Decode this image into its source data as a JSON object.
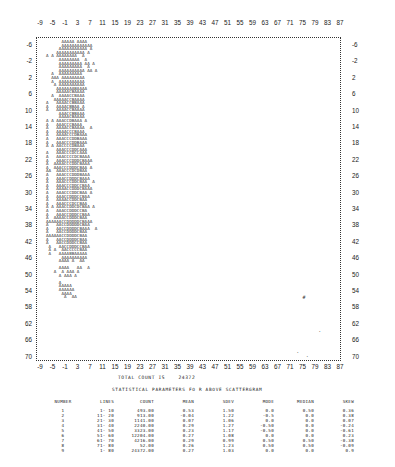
{
  "chart_data": {
    "type": "scatter",
    "xlabel": "",
    "ylabel": "",
    "x_ticks": [
      -9,
      -5,
      -1,
      3,
      7,
      11,
      15,
      19,
      23,
      27,
      31,
      35,
      39,
      43,
      47,
      51,
      55,
      59,
      63,
      67,
      71,
      75,
      79,
      83,
      87
    ],
    "y_ticks": [
      -6,
      -2,
      2,
      6,
      10,
      14,
      18,
      22,
      26,
      30,
      34,
      38,
      42,
      46,
      50,
      54,
      58,
      62,
      66,
      70
    ],
    "xlim": [
      -9,
      87
    ],
    "ylim": [
      -6,
      72
    ],
    "grid": false,
    "legend": "none",
    "density_rows": [
      "      AAAAA AAAA",
      "      AAAAAAAAAAAA",
      "     AAAAAAAAAAA A",
      "    AAAAAAAAAAA A",
      "A A AAAAAAAA  A",
      "     AAAAAAAA  A",
      "     AAAAAAAAA AA A",
      "     AAAAAAAAA  A",
      "     AAAAAAAAAA AA A",
      "  A  AAAAAAAAA",
      "  AAA AAAAAAAAA",
      "  A  AAAAAAAAAA",
      "   A AAAAAAAAAA",
      "    AAAAAAABAAAA",
      "    AAAAACBAAAA",
      "  A  AAAACCBAAA",
      "   AAAAACCBAAAA",
      "A   AAAACCBBAAA",
      "A   AAAACBBAA A",
      "A   AAAACCBAAAA",
      "     AAACCBBAAA",
      "     AAAACBAAAA",
      "A A AAACCDBAAA A",
      "A   AAACCCBAAA",
      "A   AAAACCBAAAA  A",
      "A   AAAACCCBAAA",
      "A   AAAACCCDBAAA",
      "A   AAACCCDDBAAA",
      "A   AAACCCDDBAAA",
      "A A AACCCCDBAAA",
      "    AAACCCDDCAAA",
      "A   AAACCCDCCAAA",
      "A   AAACCCCDCBAAA",
      "A   AAACCCDDDCBAAA",
      "A  AAAACCCDDCBAAA",
      "A  AAACCCDDDCBAA A",
      "AA  AAACCCDCDBAA",
      "A   AAACCCDDDBAAA",
      "A   AAACCDDDCBAAA",
      "A   AAACCCDDCBAA  A",
      "A   AAACCCDDCCBAA",
      "A   AAAACCDDDCBAAA",
      "A   AAACCCDDCBAA A",
      "A   AAACCDDDCCBAA",
      "A   AAAACCDDCBAA",
      "A   AAACCCDCCBAA",
      "A A AAACCDDCDCBAA A",
      "A   AAACCDDDCCBA",
      "A   AAACCDDDCCBAA",
      "A  AAAACCDDDCBAA",
      "AAAAAACCDDDDDCBAAA",
      "A   AACCDDDDDCBAA",
      "A   AACCDDDDCBAAA  A",
      "A   AACCDDDDCBAA",
      "AAAAAACCDDDDCBAA",
      "A   AACCDDDDCBAA",
      "A   AACCDDDCCBAA",
      " A   AACCDDDCCBAA",
      " A A  AACCCCCBAA",
      " A   AAAABBAAAAA",
      "      AAAAAAAAAA",
      "     AAAA A  AA",
      "",
      "     AAAA   AA  A",
      "   A  A AAA A",
      "     A AAA A",
      "",
      "     A",
      "     AAAAA",
      "     AAAAAA",
      "      AAAA",
      "       A  AA"
    ],
    "outliers": [
      {
        "x": 75,
        "y": 57,
        "glyph": "#"
      },
      {
        "x": 80,
        "y": 65,
        "glyph": "."
      },
      {
        "x": 73,
        "y": 70,
        "glyph": "."
      },
      {
        "x": 76,
        "y": 71,
        "glyph": "."
      },
      {
        "x": 79,
        "y": 72,
        "glyph": "."
      }
    ],
    "density_legend": "A < B < C < D (increasing point count per cell)",
    "total_count": "24372",
    "statistics_table": {
      "title": "STATISTICAL PARAMETERS FO R ABOVE SCATTERGRAM",
      "columns": [
        "NUMBER",
        "LINES",
        "COUNT",
        "MEAN",
        "SDEV",
        "MODE",
        "MEDIAN",
        "SKEW"
      ],
      "rows": [
        [
          "1",
          "1- 10",
          "493.00",
          "0.53",
          "1.50",
          "0.0",
          "0.50",
          "0.36"
        ],
        [
          "2",
          "11- 20",
          "913.00",
          "-0.04",
          "1.22",
          "-0.5",
          "0.0",
          "0.38"
        ],
        [
          "3",
          "21- 30",
          "1141.00",
          "0.07",
          "1.06",
          "0.0",
          "0.0",
          "0.07"
        ],
        [
          "4",
          "31- 40",
          "2240.00",
          "0.29",
          "1.27",
          "-0.50",
          "0.0",
          "-0.24"
        ],
        [
          "5",
          "41- 50",
          "3323.00",
          "0.23",
          "1.17",
          "-0.50",
          "0.0",
          "-0.61"
        ],
        [
          "6",
          "51- 60",
          "12204.00",
          "0.27",
          "1.08",
          "0.0",
          "0.0",
          "0.23"
        ],
        [
          "7",
          "61- 70",
          "4216.00",
          "0.29",
          "0.99",
          "0.50",
          "0.50",
          "-0.38"
        ],
        [
          "8",
          "71- 80",
          "52.00",
          "0.26",
          "1.23",
          "0.50",
          "0.50",
          "-0.09"
        ],
        [
          "9",
          "1- 80",
          "24372.00",
          "0.27",
          "1.03",
          "0.0",
          "0.0",
          "0.9"
        ]
      ]
    }
  },
  "summary": {
    "total_label": "TOTAL COUNT IS",
    "total_value": "24372"
  }
}
